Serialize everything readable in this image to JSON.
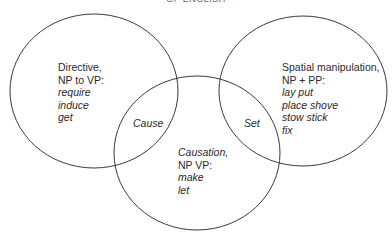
{
  "title": "OF ENGLISH",
  "sets": [
    {
      "id": "directive",
      "heading": [
        "Directive,",
        "NP to VP:"
      ],
      "verbs": [
        "require",
        "induce",
        "get"
      ]
    },
    {
      "id": "spatial",
      "heading": [
        "Spatial manipulation,",
        "NP + PP:"
      ],
      "verbs": [
        "lay put",
        "place shove",
        "stow stick",
        "fix"
      ]
    },
    {
      "id": "causation",
      "heading": [
        "Causation,",
        "NP VP:"
      ],
      "verbs": [
        "make",
        "let"
      ]
    }
  ],
  "overlaps": {
    "directive_causation": "Cause",
    "spatial_causation": "Set"
  },
  "colors": {
    "stroke": "#3a3a3a",
    "text": "#2a2a2a"
  }
}
